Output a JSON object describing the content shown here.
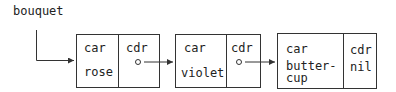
{
  "diagram": {
    "variable": "bouquet",
    "cells": [
      {
        "car_label": "car",
        "cdr_label": "cdr",
        "car_value": "rose",
        "cdr_value": "pointer"
      },
      {
        "car_label": "car",
        "cdr_label": "cdr",
        "car_value": "violet",
        "cdr_value": "pointer"
      },
      {
        "car_label": "car",
        "cdr_label": "cdr",
        "car_value": "butter-\ncup",
        "cdr_value": "nil"
      }
    ]
  }
}
